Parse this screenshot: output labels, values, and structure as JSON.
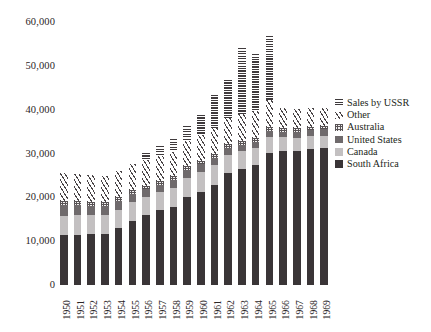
{
  "chart_data": {
    "type": "bar",
    "stacked": true,
    "title": "",
    "xlabel": "",
    "ylabel": "",
    "ylim": [
      0,
      60000
    ],
    "ytick_values": [
      0,
      10000,
      20000,
      30000,
      40000,
      50000,
      60000
    ],
    "ytick_labels": [
      "0",
      "10,000",
      "20,000",
      "30,000",
      "40,000",
      "50,000",
      "60,000"
    ],
    "grid": false,
    "legend_position": "right",
    "categories": [
      "1950",
      "1951",
      "1952",
      "1953",
      "1954",
      "1955",
      "1956",
      "1957",
      "1958",
      "1959",
      "1960",
      "1961",
      "1962",
      "1963",
      "1964",
      "1965",
      "1966",
      "1967",
      "1968",
      "1969"
    ],
    "series": [
      {
        "name": "South Africa",
        "color": "#3a3537",
        "pattern": "solid-dark",
        "values": [
          11400,
          11500,
          11600,
          11700,
          13100,
          14600,
          15900,
          17000,
          17700,
          20100,
          21200,
          22900,
          25500,
          26500,
          27300,
          30200,
          30500,
          30600,
          31100,
          31300
        ]
      },
      {
        "name": "Canada",
        "color": "#c3c0c1",
        "pattern": "solid-light",
        "values": [
          4400,
          4400,
          4300,
          4200,
          4100,
          4300,
          4100,
          4200,
          4500,
          4400,
          4600,
          4400,
          4100,
          4000,
          3900,
          3600,
          3200,
          3000,
          2800,
          2700
        ]
      },
      {
        "name": "United States",
        "color": "#6f6a6c",
        "pattern": "solid-medium",
        "values": [
          2400,
          2300,
          2200,
          2100,
          1900,
          1900,
          1800,
          1700,
          1700,
          1700,
          1700,
          1600,
          1600,
          1500,
          1400,
          1300,
          1300,
          1300,
          1400,
          1500
        ]
      },
      {
        "name": "Australia",
        "color": "#585355",
        "pattern": "crosshatch",
        "values": [
          900,
          900,
          900,
          900,
          900,
          900,
          900,
          900,
          900,
          900,
          900,
          900,
          900,
          900,
          900,
          900,
          900,
          900,
          800,
          800
        ]
      },
      {
        "name": "Other",
        "color": "#4a4547",
        "pattern": "diagonal-hatch",
        "values": [
          6400,
          6200,
          6100,
          6000,
          6000,
          5900,
          5800,
          5700,
          5600,
          5700,
          5900,
          6000,
          6000,
          6100,
          6200,
          6300,
          4500,
          4300,
          4200,
          4100
        ]
      },
      {
        "name": "Sales by USSR",
        "color": "#3f3a3c",
        "pattern": "horizontal-lines",
        "values": [
          0,
          0,
          0,
          0,
          0,
          0,
          1700,
          2300,
          2900,
          3400,
          4500,
          7600,
          8600,
          15000,
          12900,
          14500,
          0,
          0,
          0,
          0
        ]
      }
    ],
    "legend": [
      {
        "label": "Sales by USSR",
        "pattern": "horizontal-lines"
      },
      {
        "label": "Other",
        "pattern": "diagonal-hatch"
      },
      {
        "label": "Australia",
        "pattern": "crosshatch"
      },
      {
        "label": "United States",
        "pattern": "solid-medium"
      },
      {
        "label": "Canada",
        "pattern": "solid-light"
      },
      {
        "label": "South Africa",
        "pattern": "solid-dark"
      }
    ]
  }
}
